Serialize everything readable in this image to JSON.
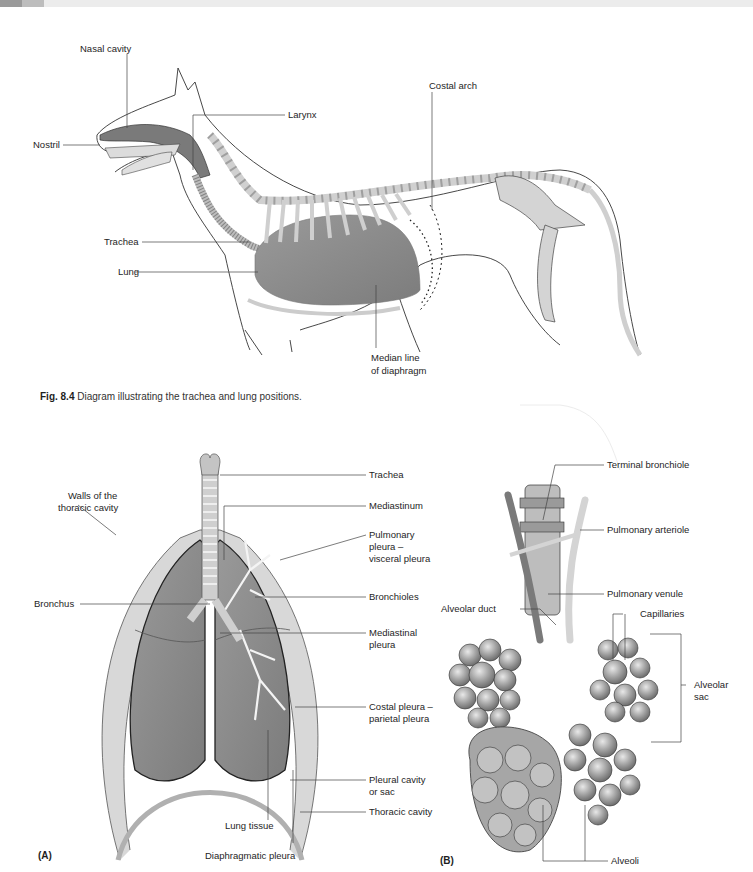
{
  "header": {
    "page_number": "94",
    "colors": {
      "bar": "#ececec",
      "tab": "#9a9a9a"
    }
  },
  "figure_top": {
    "subject": "Dog lateral view with respiratory tract and skeleton",
    "labels": {
      "nasal_cavity": "Nasal cavity",
      "nostril": "Nostril",
      "larynx": "Larynx",
      "costal_arch": "Costal arch",
      "trachea": "Trachea",
      "lung": "Lung",
      "median_line": "Median line",
      "of_diaphragm": "of diaphragm"
    },
    "caption": {
      "fig_number": "Fig. 8.4",
      "text": "Diagram illustrating the trachea and lung positions."
    }
  },
  "figure_a": {
    "panel_label": "(A)",
    "labels": {
      "trachea": "Trachea",
      "walls_1": "Walls of the",
      "walls_2": "thoracic cavity",
      "mediastinum": "Mediastinum",
      "pulmonary_1": "Pulmonary",
      "pulmonary_2": "pleura –",
      "pulmonary_3": "visceral pleura",
      "bronchus": "Bronchus",
      "bronchioles": "Bronchioles",
      "mediastinal_1": "Mediastinal",
      "mediastinal_2": "pleura",
      "costal_1": "Costal pleura –",
      "costal_2": "parietal pleura",
      "pleural_1": "Pleural cavity",
      "pleural_2": "or sac",
      "thoracic_cavity": "Thoracic cavity",
      "lung_tissue": "Lung tissue",
      "diaphragmatic_pleura": "Diaphragmatic pleura"
    },
    "colors": {
      "lung": "#8a8a8a",
      "pleura": "#d6d6d6",
      "wall": "#a8a8a8"
    }
  },
  "figure_b": {
    "panel_label": "(B)",
    "labels": {
      "terminal_bronchiole": "Terminal bronchiole",
      "pulmonary_arteriole": "Pulmonary arteriole",
      "pulmonary_venule": "Pulmonary venule",
      "alveolar_duct": "Alveolar duct",
      "capillaries": "Capillaries",
      "alveolar_1": "Alveolar",
      "alveolar_2": "sac",
      "alveoli": "Alveoli"
    },
    "colors": {
      "alveoli": "#9c9c9c",
      "vessel_light": "#d4d4d4",
      "vessel_dark": "#7a7a7a"
    }
  }
}
